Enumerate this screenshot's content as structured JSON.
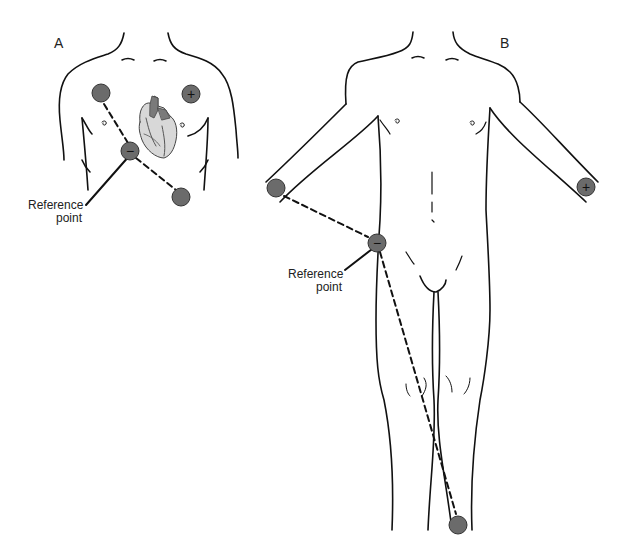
{
  "panels": [
    {
      "id": "A",
      "label": "A",
      "description": "Chest torso with heart, three electrodes",
      "reference_label_line1": "Reference",
      "reference_label_line2": "point",
      "electrodes": [
        {
          "name": "right-upper-chest",
          "sign": ""
        },
        {
          "name": "left-upper-chest",
          "sign": "+"
        },
        {
          "name": "reference-center",
          "sign": "−"
        },
        {
          "name": "lower-left-chest",
          "sign": ""
        }
      ]
    },
    {
      "id": "B",
      "label": "B",
      "description": "Full body with limb electrodes",
      "reference_label_line1": "Reference",
      "reference_label_line2": "point",
      "electrodes": [
        {
          "name": "right-arm",
          "sign": ""
        },
        {
          "name": "left-arm",
          "sign": "+"
        },
        {
          "name": "reference-hip",
          "sign": "−"
        },
        {
          "name": "left-ankle",
          "sign": ""
        }
      ]
    }
  ],
  "colors": {
    "electrode_fill": "#6b6b6b",
    "electrode_stroke": "#333333",
    "line": "#111111",
    "heart_light": "#d8d8d8",
    "heart_dark": "#7a7a7a"
  }
}
